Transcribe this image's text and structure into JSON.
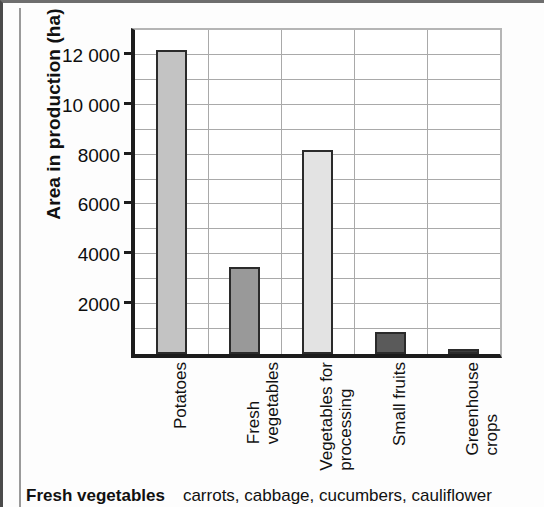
{
  "figure": {
    "y_axis_title": "Area in production (ha)",
    "caption_bold": "Fresh vegetables",
    "caption_rest": "carrots, cabbage, cucumbers, cauliflower"
  },
  "chart_data": {
    "type": "bar",
    "title": "",
    "xlabel": "",
    "ylabel": "Area in production (ha)",
    "categories": [
      "Potatoes",
      "Fresh vegetables",
      "Vegetables for processing",
      "Small fruits",
      "Greenhouse crops"
    ],
    "category_lines": [
      [
        "Potatoes",
        ""
      ],
      [
        "Fresh",
        "vegetables"
      ],
      [
        "Vegetables for",
        "processing"
      ],
      [
        "Small fruits",
        ""
      ],
      [
        "Greenhouse",
        "crops"
      ]
    ],
    "values": [
      12200,
      3500,
      8200,
      900,
      200
    ],
    "bar_colors": [
      "#c3c3c3",
      "#999999",
      "#e3e3e3",
      "#5a5a5a",
      "#3d3d3d"
    ],
    "ylim": [
      0,
      13000
    ],
    "ytick_labels": [
      "2000",
      "4000",
      "6000",
      "8000",
      "10 000",
      "12 000"
    ],
    "ytick_values": [
      2000,
      4000,
      6000,
      8000,
      10000,
      12000
    ],
    "minor_gridline_step": 1000,
    "grid": true,
    "legend": "none",
    "units": "ha"
  }
}
